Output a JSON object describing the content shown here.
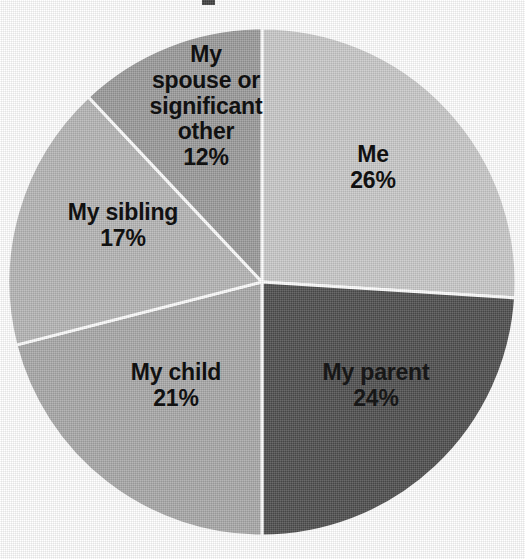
{
  "chart_data": {
    "type": "pie",
    "title": "",
    "xlabel": "",
    "ylabel": "",
    "legend": "none",
    "grid": false,
    "units": "percent",
    "start_angle_deg": 0,
    "direction": "clockwise",
    "categories": [
      "Me",
      "My parent",
      "My child",
      "My sibling",
      "My spouse or significant other"
    ],
    "values": [
      26,
      24,
      21,
      17,
      12
    ],
    "labels": [
      "26%",
      "24%",
      "21%",
      "17%",
      "12%"
    ],
    "colors": [
      "#c9c9c9",
      "#4e4e4e",
      "#a9a9a9",
      "#b6b6b6",
      "#9b9b9b"
    ],
    "slices": [
      {
        "name": "Me",
        "value": 26,
        "value_label": "26%",
        "color": "#c9c9c9",
        "label_lines": [
          "Me"
        ]
      },
      {
        "name": "My parent",
        "value": 24,
        "value_label": "24%",
        "color": "#4e4e4e",
        "label_lines": [
          "My parent"
        ]
      },
      {
        "name": "My child",
        "value": 21,
        "value_label": "21%",
        "color": "#a9a9a9",
        "label_lines": [
          "My child"
        ]
      },
      {
        "name": "My sibling",
        "value": 17,
        "value_label": "17%",
        "color": "#b6b6b6",
        "label_lines": [
          "My sibling"
        ]
      },
      {
        "name": "My spouse or significant other",
        "value": 12,
        "value_label": "12%",
        "color": "#9b9b9b",
        "label_lines": [
          "My",
          "spouse or",
          "significant",
          "other"
        ]
      }
    ]
  },
  "style": {
    "separator_color": "#ffffff",
    "separator_width": 3,
    "background": "#ffffff",
    "label_color": "#111111",
    "center_x": 262,
    "center_y": 282,
    "radius": 254
  },
  "labels": {
    "me": {
      "line1": "Me",
      "value": "26%"
    },
    "my_parent": {
      "line1": "My parent",
      "value": "24%"
    },
    "my_child": {
      "line1": "My child",
      "value": "21%"
    },
    "my_sibling": {
      "line1": "My sibling",
      "value": "17%"
    },
    "my_spouse": {
      "line1": "My",
      "line2": "spouse or",
      "line3": "significant",
      "line4": "other",
      "value": "12%"
    }
  }
}
